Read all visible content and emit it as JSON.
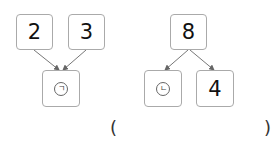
{
  "left_tree": {
    "top_left": "2",
    "top_right": "3",
    "bottom": "ㄱ"
  },
  "right_tree": {
    "top": "8",
    "bottom_left": "ㄴ",
    "bottom_right": "4"
  },
  "answer": {
    "open": "(",
    "close": ")",
    "value": ""
  }
}
